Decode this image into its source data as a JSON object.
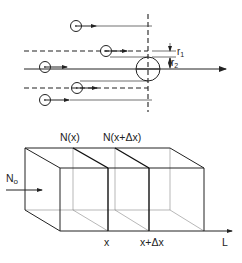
{
  "top_panel": {
    "labels": {
      "r1": "r",
      "r1_sub": "1",
      "r2": "r",
      "r2_sub": "2"
    },
    "target_particle": {
      "cx": 148,
      "cy": 69,
      "r": 12
    },
    "incoming_particles": [
      {
        "cx": 76,
        "cy": 26
      },
      {
        "cx": 106,
        "cy": 51
      },
      {
        "cx": 45,
        "cy": 67
      },
      {
        "cx": 77,
        "cy": 88
      },
      {
        "cx": 45,
        "cy": 100
      }
    ]
  },
  "bottom_panel": {
    "labels": {
      "slice_left": "N(x)",
      "slice_right": "N(x+Δx)",
      "incident": "N",
      "incident_sub": "o",
      "x": "x",
      "x_dx": "x+Δx",
      "axis": "L"
    }
  },
  "colors": {
    "stroke": "#222222",
    "background": "#ffffff"
  }
}
